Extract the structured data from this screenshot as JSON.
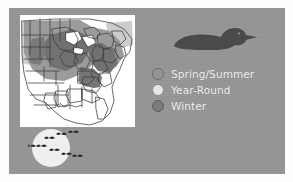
{
  "figure": {
    "name": "loon-range-map-figure",
    "background_color": "#949494",
    "panel_color": "#949494"
  },
  "map": {
    "name": "us-range-map",
    "region": "Eastern and Central United States",
    "background": "#ffffff",
    "outline_color": "#3a3a3a",
    "shading": {
      "spring_summer_color": "#9a9a9a",
      "year_round_color": "#6f6f6f",
      "winter_color": "#c9c9c9",
      "unshaded_color": "#ffffff"
    }
  },
  "bird_silhouette": {
    "name": "loon-silhouette",
    "species": "loon",
    "color": "#4a4a4a",
    "pose": "swimming-profile-facing-right"
  },
  "migration_graphic": {
    "name": "migrating-birds-over-moon",
    "moon_color": "#efefef",
    "bird_color": "#2e2e2e",
    "bird_count": 8
  },
  "legend": {
    "title": "",
    "items": [
      {
        "label": "Spring/Summer",
        "swatch_color": "#949494",
        "swatch_style": "outlined"
      },
      {
        "label": "Year-Round",
        "swatch_color": "#e6e6e6",
        "swatch_style": "filled-light"
      },
      {
        "label": "Winter",
        "swatch_color": "#7b7b7b",
        "swatch_style": "filled-dark"
      }
    ],
    "text_color": "#f2f2f2"
  }
}
